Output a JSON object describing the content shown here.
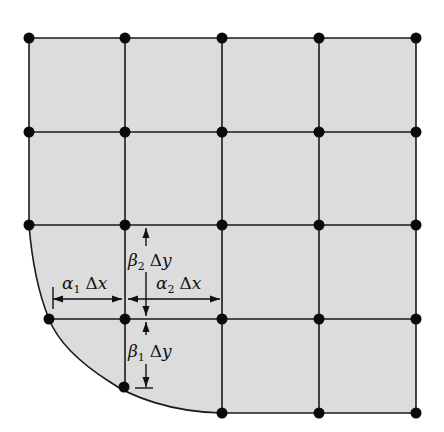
{
  "diagram": {
    "title": "",
    "colors": {
      "background": "#ffffff",
      "region_fill": "#dcdcdc",
      "line": "#1a1a1a",
      "node": "#0a0a0a"
    },
    "grid": {
      "columns_x": [
        29,
        125,
        222,
        319,
        416
      ],
      "rows_y": [
        38,
        132,
        225,
        319,
        412
      ]
    },
    "curved_boundary": {
      "description": "curved lower-left boundary of the domain",
      "points": [
        [
          29,
          225
        ],
        [
          49,
          319
        ],
        [
          124,
          387
        ],
        [
          222,
          413
        ]
      ]
    },
    "nodes": [
      {
        "x": 29,
        "y": 38
      },
      {
        "x": 125,
        "y": 38
      },
      {
        "x": 222,
        "y": 38
      },
      {
        "x": 319,
        "y": 38
      },
      {
        "x": 416,
        "y": 38
      },
      {
        "x": 29,
        "y": 132
      },
      {
        "x": 125,
        "y": 132
      },
      {
        "x": 222,
        "y": 132
      },
      {
        "x": 319,
        "y": 132
      },
      {
        "x": 416,
        "y": 132
      },
      {
        "x": 29,
        "y": 225
      },
      {
        "x": 125,
        "y": 225
      },
      {
        "x": 222,
        "y": 225
      },
      {
        "x": 319,
        "y": 225
      },
      {
        "x": 416,
        "y": 225
      },
      {
        "x": 49,
        "y": 319
      },
      {
        "x": 125,
        "y": 319
      },
      {
        "x": 222,
        "y": 319
      },
      {
        "x": 319,
        "y": 319
      },
      {
        "x": 416,
        "y": 319
      },
      {
        "x": 124,
        "y": 387
      },
      {
        "x": 222,
        "y": 413
      },
      {
        "x": 319,
        "y": 413
      },
      {
        "x": 416,
        "y": 413
      }
    ],
    "annotations": {
      "alpha1": {
        "greek": "α",
        "sub": "1",
        "delta": "Δ",
        "var": "x"
      },
      "alpha2": {
        "greek": "α",
        "sub": "2",
        "delta": "Δ",
        "var": "x"
      },
      "beta1": {
        "greek": "β",
        "sub": "1",
        "delta": "Δ",
        "var": "y"
      },
      "beta2": {
        "greek": "β",
        "sub": "2",
        "delta": "Δ",
        "var": "y"
      }
    }
  }
}
